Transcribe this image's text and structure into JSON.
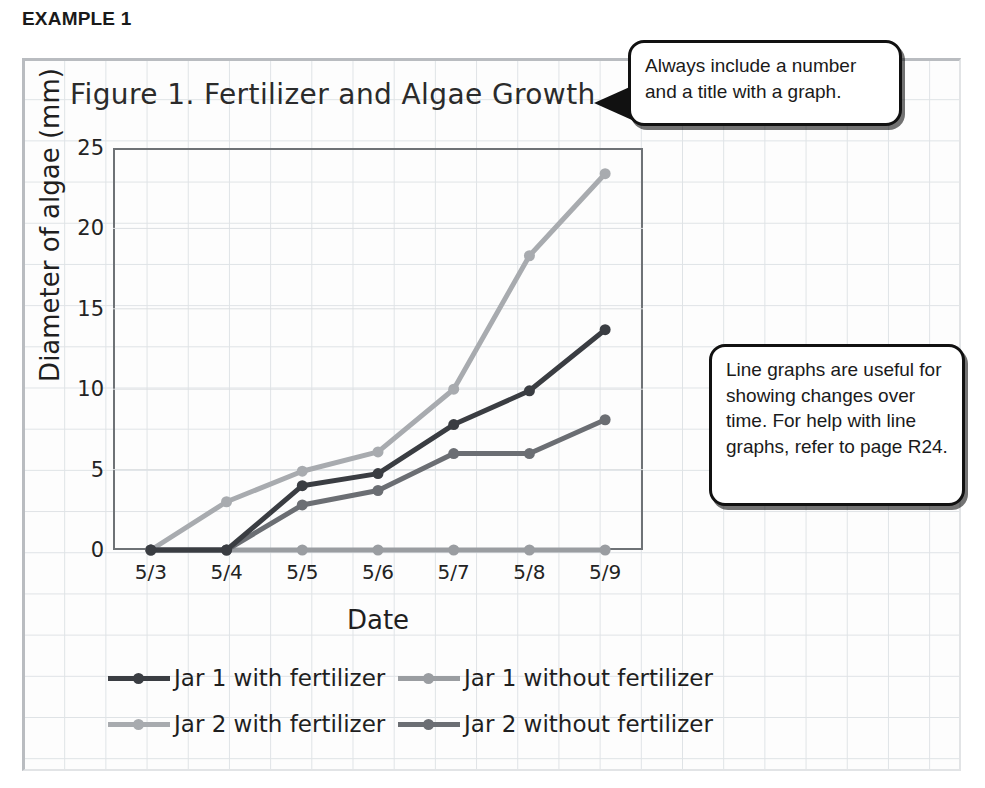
{
  "example_label": "EXAMPLE 1",
  "callouts": [
    {
      "id": "callout-1",
      "text": "Always include a number and a title with a graph."
    },
    {
      "id": "callout-2",
      "text": "Line graphs are useful for showing changes over time. For help with line graphs, refer to page R24."
    }
  ],
  "chart_data": {
    "type": "line",
    "title": "Figure 1. Fertilizer and Algae Growth",
    "xlabel": "Date",
    "ylabel": "Diameter of algae (mm)",
    "categories": [
      "5/3",
      "5/4",
      "5/5",
      "5/6",
      "5/7",
      "5/8",
      "5/9"
    ],
    "ylim": [
      0,
      25
    ],
    "yticks": [
      0,
      5,
      10,
      15,
      20,
      25
    ],
    "grid": true,
    "legend_position": "bottom",
    "series": [
      {
        "name": "Jar 1 with fertilizer",
        "color": "#3a3d42",
        "values": [
          0,
          0,
          4.0,
          4.75,
          7.8,
          9.9,
          13.7
        ]
      },
      {
        "name": "Jar 1 without fertilizer",
        "color": "#9a9da1",
        "values": [
          0,
          0,
          0,
          0,
          0,
          0,
          0
        ]
      },
      {
        "name": "Jar 2 with fertilizer",
        "color": "#a8abaf",
        "values": [
          0,
          3.0,
          4.9,
          6.1,
          10.0,
          18.3,
          23.4
        ]
      },
      {
        "name": "Jar 2 without fertilizer",
        "color": "#6b6e73",
        "values": [
          0,
          0,
          2.8,
          3.7,
          6.0,
          6.0,
          8.1
        ]
      }
    ]
  }
}
